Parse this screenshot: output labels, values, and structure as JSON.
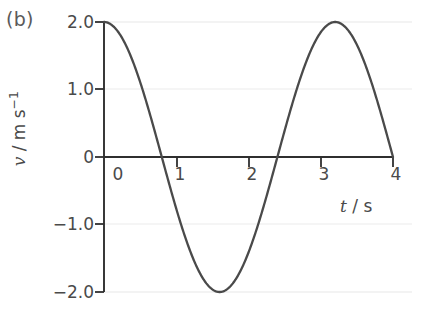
{
  "panel": {
    "label": "(b)"
  },
  "chart_data": {
    "type": "line",
    "title": "",
    "subtitle": "",
    "xlabel": "t / s",
    "xlabel_symbol": "t",
    "xlabel_unit": "/ s",
    "ylabel": "v / m s⁻¹",
    "ylabel_symbol": "v",
    "ylabel_unit": "/ m s",
    "ylabel_unit_exponent": "−1",
    "xlim": [
      0,
      4
    ],
    "ylim": [
      -2.0,
      2.0
    ],
    "xticks": [
      0,
      1,
      2,
      3,
      4
    ],
    "xtick_labels": [
      "0",
      "1",
      "2",
      "3",
      "4"
    ],
    "yticks": [
      2.0,
      1.0,
      0,
      -1.0,
      -2.0
    ],
    "ytick_labels": [
      "2.0",
      "1.0",
      "0",
      "−1.0",
      "−2.0"
    ],
    "grid": true,
    "grid_axis": "y",
    "legend": false,
    "legend_position": "none",
    "series": [
      {
        "name": "velocity",
        "color": "#4a4a4a",
        "line_width": 2.3,
        "equation": "v = 2.0 cos(2πt / 3.2)",
        "amplitude": 2.0,
        "period": 3.2,
        "x": [
          0.0,
          0.1,
          0.2,
          0.3,
          0.4,
          0.5,
          0.6,
          0.7,
          0.8,
          0.9,
          1.0,
          1.1,
          1.2,
          1.3,
          1.4,
          1.5,
          1.6,
          1.7,
          1.8,
          1.9,
          2.0,
          2.1,
          2.2,
          2.3,
          2.4,
          2.5,
          2.6,
          2.7,
          2.8,
          2.9,
          3.0,
          3.1,
          3.2,
          3.3,
          3.4,
          3.5,
          3.6,
          3.7,
          3.8,
          3.9,
          4.0
        ],
        "y": [
          2.0,
          1.96,
          1.85,
          1.66,
          1.41,
          1.11,
          0.77,
          0.39,
          0.0,
          -0.39,
          -0.77,
          -1.11,
          -1.41,
          -1.66,
          -1.85,
          -1.96,
          -2.0,
          -1.96,
          -1.85,
          -1.66,
          -1.41,
          -1.11,
          -0.77,
          -0.39,
          0.0,
          0.39,
          0.77,
          1.11,
          1.41,
          1.66,
          1.85,
          1.96,
          2.0,
          1.96,
          1.85,
          1.66,
          1.41,
          1.11,
          0.77,
          0.39,
          0.0
        ]
      }
    ],
    "key_points": {
      "start": [
        0,
        2.0
      ],
      "first_zero": [
        0.8,
        0
      ],
      "minimum": [
        1.6,
        -2.0
      ],
      "second_zero": [
        2.4,
        0
      ],
      "maximum": [
        3.2,
        2.0
      ],
      "end": [
        4.0,
        0
      ]
    },
    "colors": {
      "curve": "#4a4a4a",
      "axis": "#2b2b2b",
      "grid": "#eeeeee",
      "text": "#4a4a4a",
      "background": "#ffffff"
    }
  }
}
